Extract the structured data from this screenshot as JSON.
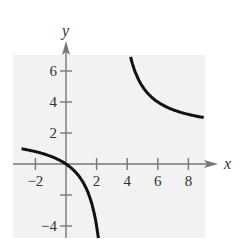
{
  "chart_data": {
    "type": "line",
    "title": "",
    "xlabel": "x",
    "ylabel": "y",
    "function": "y = 2x/(x - 3)",
    "asymptotes": {
      "vertical": 3,
      "horizontal": 2
    },
    "xlim": [
      -3,
      9.8
    ],
    "ylim": [
      -4.8,
      7.8
    ],
    "x_ticks": [
      -2,
      2,
      4,
      6,
      8
    ],
    "x_tick_labels": [
      "−2",
      "2",
      "4",
      "6",
      "8"
    ],
    "y_ticks": [
      -4,
      -2,
      2,
      4,
      6
    ],
    "y_tick_labels": [
      "−4",
      "",
      "2",
      "4",
      "6"
    ],
    "grid": false,
    "background_color": "#f2f2f2",
    "curve_color": "#111111",
    "series": [
      {
        "name": "left branch",
        "x": [
          -2.9,
          -2.5,
          -2,
          -1.5,
          -1,
          -0.5,
          0,
          0.5,
          1,
          1.3,
          1.6,
          1.8,
          2,
          2.1,
          2.2
        ],
        "y": [
          0.98,
          0.91,
          0.8,
          0.67,
          0.5,
          0.29,
          0,
          -0.4,
          -1,
          -1.53,
          -2.29,
          -3,
          -4,
          -4.67,
          -5.5
        ]
      },
      {
        "name": "right branch",
        "x": [
          4.22,
          4.4,
          4.6,
          5,
          5.5,
          6,
          6.5,
          7,
          7.5,
          8,
          8.5,
          9
        ],
        "y": [
          6.92,
          6.29,
          5.75,
          5,
          4.4,
          4,
          3.71,
          3.5,
          3.33,
          3.2,
          3.09,
          3
        ]
      }
    ]
  },
  "axes": {
    "x_label": "x",
    "y_label": "y"
  }
}
